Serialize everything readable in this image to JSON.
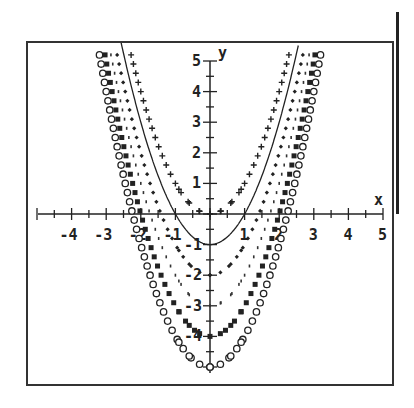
{
  "chart_data": {
    "type": "scatter",
    "title": "",
    "xlabel": "x",
    "ylabel": "y",
    "xlim": [
      -5,
      5
    ],
    "ylim": [
      -5,
      5
    ],
    "grid": false,
    "legend": "none",
    "x_tick_labels": [
      "-4",
      "-3",
      "-2",
      "-1",
      "1",
      "2",
      "3",
      "4",
      "5"
    ],
    "y_tick_labels": [
      "5",
      "4",
      "3",
      "2",
      "1",
      "-1",
      "-2",
      "-3",
      "-4"
    ],
    "series": [
      {
        "name": "y = x^2",
        "marker": "plus",
        "c": 0
      },
      {
        "name": "y = x^2 - 1",
        "marker": "line",
        "c": -1
      },
      {
        "name": "y = x^2 - 2",
        "marker": "diamond-dot",
        "c": -2
      },
      {
        "name": "y = x^2 - 3",
        "marker": "small-dot",
        "c": -3
      },
      {
        "name": "y = x^2 - 4",
        "marker": "square",
        "c": -4
      },
      {
        "name": "y = x^2 - 5",
        "marker": "circle",
        "c": -5
      }
    ]
  },
  "axes": {
    "x_label": "x",
    "y_label": "y",
    "color": "#222222"
  }
}
